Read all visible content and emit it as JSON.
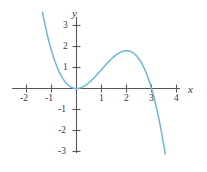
{
  "figure": {
    "kind": "cartesian-graph",
    "background_color": "#ffffff",
    "axis_color": "#58585a",
    "label_color": "#3b3b3b",
    "curve_color": "#6bb8d6"
  },
  "axes": {
    "x_axis_label": "x",
    "y_axis_label": "y",
    "x_tick_labels": [
      "-2",
      "-1",
      "1",
      "2",
      "3",
      "4"
    ],
    "y_tick_labels": [
      "3",
      "2",
      "1",
      "-1",
      "-2",
      "-3"
    ]
  },
  "chart_data": {
    "type": "line",
    "title": "",
    "xlabel": "x",
    "ylabel": "y",
    "xlim": [
      -2.55,
      4.55
    ],
    "ylim": [
      -3.6,
      3.75
    ],
    "xticks": [
      -2,
      -1,
      1,
      2,
      3,
      4
    ],
    "yticks": [
      3,
      2,
      1,
      -1,
      -2,
      -3
    ],
    "grid": false,
    "legend": "none",
    "series": [
      {
        "name": "cubic",
        "equation": "y = 0.45 x^2 (3 - x)",
        "roots": [
          0,
          3
        ],
        "local_minimum": {
          "x": 0,
          "y": 0
        },
        "local_maximum": {
          "x": 2,
          "y": 1.25
        },
        "x_domain": [
          -1.36,
          3.55
        ],
        "x": [
          -1.36,
          -1.2,
          -1.0,
          -0.8,
          -0.6,
          -0.4,
          -0.2,
          0.0,
          0.25,
          0.5,
          0.75,
          1.0,
          1.25,
          1.5,
          1.75,
          2.0,
          2.25,
          2.5,
          2.75,
          3.0,
          3.15,
          3.3,
          3.45,
          3.55
        ],
        "y": [
          3.65,
          3.02,
          2.25,
          1.64,
          1.15,
          0.77,
          0.47,
          0.0,
          0.19,
          0.28,
          0.57,
          0.9,
          1.1,
          1.21,
          1.26,
          1.25,
          1.14,
          0.95,
          0.62,
          0.0,
          -0.53,
          -0.98,
          -1.65,
          -2.5
        ]
      }
    ]
  }
}
